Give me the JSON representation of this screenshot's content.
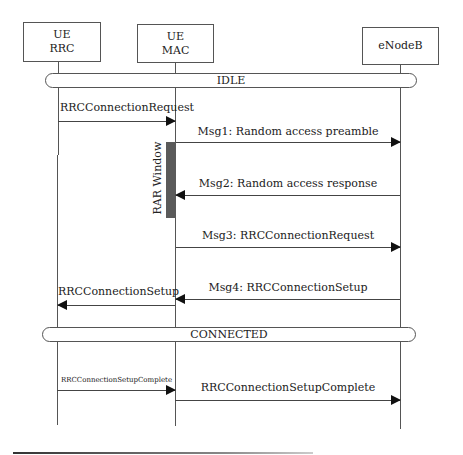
{
  "diagram": {
    "type": "sequence",
    "participants": [
      {
        "id": "ue_rrc",
        "line1": "UE",
        "line2": "RRC"
      },
      {
        "id": "ue_mac",
        "line1": "UE",
        "line2": "MAC"
      },
      {
        "id": "enodeb",
        "line1": "eNodeB",
        "line2": ""
      }
    ],
    "states": {
      "idle": "IDLE",
      "connected": "CONNECTED"
    },
    "messages": [
      {
        "from": "ue_rrc",
        "to": "ue_mac",
        "label": "RRCConnectionRequest"
      },
      {
        "from": "ue_mac",
        "to": "enodeb",
        "label": "Msg1: Random access preamble"
      },
      {
        "from": "enodeb",
        "to": "ue_mac",
        "label": "Msg2: Random access response"
      },
      {
        "from": "ue_mac",
        "to": "enodeb",
        "label": "Msg3: RRCConnectionRequest"
      },
      {
        "from": "enodeb",
        "to": "ue_mac",
        "label": "Msg4: RRCConnectionSetup"
      },
      {
        "from": "ue_mac",
        "to": "ue_rrc",
        "label": "RRCConnectionSetup"
      },
      {
        "from": "ue_rrc",
        "to": "ue_mac",
        "label": "RRCConnectionSetupComplete"
      },
      {
        "from": "ue_mac",
        "to": "enodeb",
        "label": "RRCConnectionSetupComplete"
      }
    ],
    "rar_window": {
      "label": "RAR Window",
      "color": "#5a5a5a"
    }
  }
}
